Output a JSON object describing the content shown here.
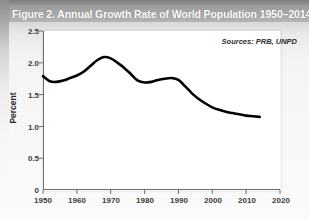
{
  "figure": {
    "title": "Figure 2. Annual Growth Rate of World Population 1950–2014",
    "source_note": "Sources: PRB, UNPD"
  },
  "chart_data": {
    "type": "line",
    "title": "Figure 2. Annual Growth Rate of World Population 1950–2014",
    "xlabel": "",
    "ylabel": "Percent",
    "xlim": [
      1950,
      2020
    ],
    "ylim": [
      0,
      2.5
    ],
    "xticks": [
      1950,
      1960,
      1970,
      1980,
      1990,
      2000,
      2010,
      2020
    ],
    "yticks": [
      0,
      0.5,
      1.0,
      1.5,
      2.0,
      2.5
    ],
    "ytick_labels": [
      "0",
      "0.5",
      "1.0",
      "1.5",
      "2.0",
      "2.5"
    ],
    "xtick_labels": [
      "1950",
      "1960",
      "1970",
      "1980",
      "1990",
      "2000",
      "2010",
      "2020"
    ],
    "grid": false,
    "legend": "none",
    "annotations": [
      "Sources: PRB, UNPD"
    ],
    "line_color": "#000000",
    "line_width": 2.6,
    "series": [
      {
        "name": "Annual growth rate of world population",
        "x": [
          1950,
          1952,
          1954,
          1956,
          1958,
          1960,
          1962,
          1964,
          1966,
          1968,
          1970,
          1972,
          1974,
          1976,
          1978,
          1980,
          1982,
          1984,
          1986,
          1988,
          1990,
          1992,
          1994,
          1996,
          1998,
          2000,
          2002,
          2004,
          2006,
          2008,
          2010,
          2012,
          2014
        ],
        "values": [
          1.79,
          1.71,
          1.7,
          1.72,
          1.76,
          1.8,
          1.86,
          1.95,
          2.04,
          2.09,
          2.07,
          2.0,
          1.92,
          1.82,
          1.72,
          1.69,
          1.7,
          1.73,
          1.75,
          1.76,
          1.73,
          1.63,
          1.52,
          1.43,
          1.36,
          1.3,
          1.26,
          1.23,
          1.21,
          1.19,
          1.17,
          1.16,
          1.15
        ]
      }
    ]
  },
  "axis": {
    "y_label": "Percent",
    "y_ticks": [
      "2.5",
      "2.0",
      "1.5",
      "1.0",
      "0.5",
      "0"
    ],
    "x_ticks": [
      "1950",
      "1960",
      "1970",
      "1980",
      "1990",
      "2000",
      "2010",
      "2020"
    ]
  }
}
